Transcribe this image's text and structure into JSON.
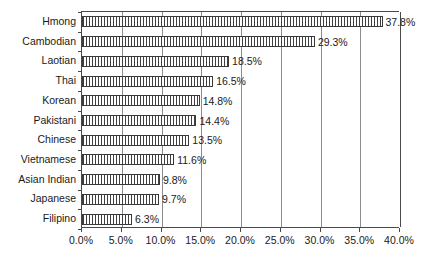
{
  "chart_data": {
    "type": "bar",
    "orientation": "horizontal",
    "title": "",
    "subtitle": "",
    "xlabel": "",
    "ylabel": "",
    "categories": [
      "Hmong",
      "Cambodian",
      "Laotian",
      "Thai",
      "Korean",
      "Pakistani",
      "Chinese",
      "Vietnamese",
      "Asian Indian",
      "Japanese",
      "Filipino"
    ],
    "values": [
      37.8,
      29.3,
      18.5,
      16.5,
      14.8,
      14.4,
      13.5,
      11.6,
      9.8,
      9.7,
      6.3
    ],
    "value_labels": [
      "37.8%",
      "29.3%",
      "18.5%",
      "16.5%",
      "14.8%",
      "14.4%",
      "13.5%",
      "11.6%",
      "9.8%",
      "9.7%",
      "6.3%"
    ],
    "xlim": [
      0,
      40
    ],
    "xticks": [
      0,
      5,
      10,
      15,
      20,
      25,
      30,
      35,
      40
    ],
    "xtick_labels": [
      "0.0%",
      "5.0%",
      "10.0%",
      "15.0%",
      "20.0%",
      "25.0%",
      "30.0%",
      "35.0%",
      "40.0%"
    ],
    "grid": true,
    "grid_axis": "x",
    "legend": false,
    "legend_position": "none",
    "bar_fill": "vertical-hatch",
    "colors": {
      "bar_border": "#3a3a3a",
      "bar_hatch": "#3f3f3f",
      "bar_background": "#ffffff",
      "gridline": "#8c8c8c",
      "axis": "#4a4a4a",
      "text": "#1a1a1a",
      "plot_background": "#ffffff"
    }
  }
}
